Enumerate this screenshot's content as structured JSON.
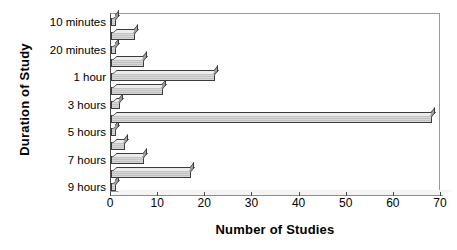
{
  "chart_data": {
    "type": "bar",
    "orientation": "horizontal",
    "title": "",
    "xlabel": "Number of Studies",
    "ylabel": "Duration of Study",
    "xlim": [
      0,
      70
    ],
    "xticks": [
      0,
      10,
      20,
      30,
      40,
      50,
      60,
      70
    ],
    "grid": false,
    "legend": null,
    "categories": [
      "10 minutes",
      "",
      "20 minutes",
      "",
      "1 hour",
      "",
      "3 hours",
      "",
      "5 hours",
      "",
      "7 hours",
      "",
      "9 hours"
    ],
    "visible_category_labels": [
      "10 minutes",
      "20 minutes",
      "1 hour",
      "3 hours",
      "5 hours",
      "7 hours",
      "9 hours"
    ],
    "values": [
      1,
      5,
      1,
      7,
      22,
      11,
      2,
      68,
      1,
      3,
      7,
      17,
      1
    ],
    "bar_style": "3d-shaded",
    "bar_fill_color": "#cccccc",
    "bar_edge_color": "#333333",
    "plot_background": "#ffffff"
  }
}
